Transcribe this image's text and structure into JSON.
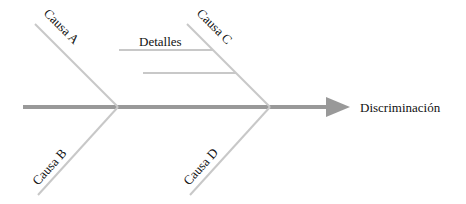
{
  "diagram": {
    "type": "fishbone",
    "effect": "Discriminación",
    "causes": [
      {
        "id": "A",
        "label": "Causa A",
        "position": "top-left"
      },
      {
        "id": "B",
        "label": "Causa B",
        "position": "bottom-left"
      },
      {
        "id": "C",
        "label": "Causa C",
        "position": "top-right",
        "details": [
          "Detalles",
          ""
        ]
      },
      {
        "id": "D",
        "label": "Causa D",
        "position": "bottom-right"
      }
    ],
    "colors": {
      "spine": "#999999",
      "bones": "#c8c8c8",
      "text": "#111111"
    }
  }
}
